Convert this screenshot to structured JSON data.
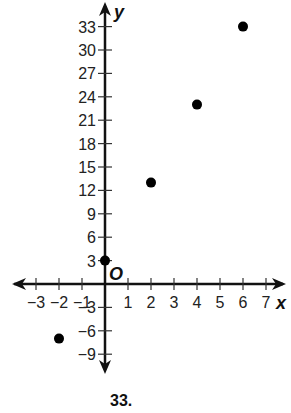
{
  "chart_data": {
    "type": "scatter",
    "title": "",
    "xlabel": "x",
    "ylabel": "y",
    "origin_label": "O",
    "xlim": [
      -3.5,
      7.5
    ],
    "ylim": [
      -10.5,
      35
    ],
    "x_ticks": [
      -3,
      -2,
      -1,
      1,
      2,
      3,
      4,
      5,
      6,
      7
    ],
    "y_ticks": [
      -9,
      -6,
      -3,
      3,
      6,
      9,
      12,
      15,
      18,
      21,
      24,
      27,
      30,
      33
    ],
    "grid": false,
    "legend": null,
    "series": [
      {
        "name": "points",
        "x": [
          -2,
          0,
          2,
          4,
          6
        ],
        "y": [
          -7,
          3,
          13,
          23,
          33
        ]
      }
    ]
  },
  "footer": {
    "problem_number": "33."
  }
}
